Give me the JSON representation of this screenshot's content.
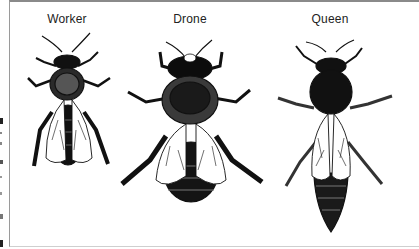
{
  "figure": {
    "labels": [
      {
        "id": "worker",
        "text": "Worker"
      },
      {
        "id": "drone",
        "text": "Drone"
      },
      {
        "id": "queen",
        "text": "Queen"
      }
    ]
  },
  "colors": {
    "ink": "#111111",
    "frame": "#8a8a8a",
    "background": "#ffffff"
  }
}
